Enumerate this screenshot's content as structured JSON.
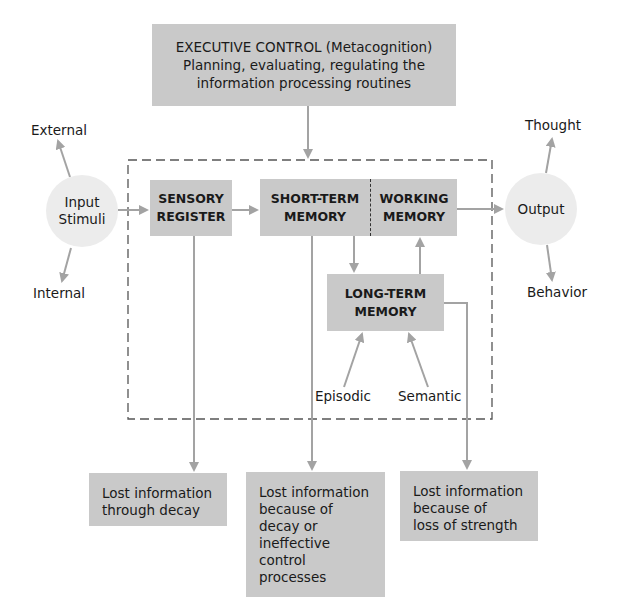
{
  "executive": {
    "line1": "EXECUTIVE CONTROL (Metacognition)",
    "line2": "Planning, evaluating, regulating the",
    "line3": "information processing routines"
  },
  "input": {
    "line1": "Input",
    "line2": "Stimuli",
    "sources": [
      "External",
      "Internal"
    ]
  },
  "sensory_register": {
    "line1": "SENSORY",
    "line2": "REGISTER"
  },
  "short_term_memory": {
    "line1": "SHORT-TERM",
    "line2": "MEMORY"
  },
  "working_memory": {
    "line1": "WORKING",
    "line2": "MEMORY"
  },
  "long_term_memory": {
    "line1": "LONG-TERM",
    "line2": "MEMORY",
    "types": [
      "Episodic",
      "Semantic"
    ]
  },
  "output": {
    "label": "Output",
    "results": [
      "Thought",
      "Behavior"
    ]
  },
  "losses": [
    {
      "lines": [
        "Lost information",
        "through decay"
      ]
    },
    {
      "lines": [
        "Lost information",
        "because of",
        "decay or",
        "ineffective",
        "control",
        "processes"
      ]
    },
    {
      "lines": [
        "Lost information",
        "because of",
        "loss of strength"
      ]
    }
  ],
  "colors": {
    "box_fill": "#c9c9c9",
    "circle_fill": "#ececec",
    "arrow": "#a3a3a3",
    "dashed_border": "#555555"
  }
}
